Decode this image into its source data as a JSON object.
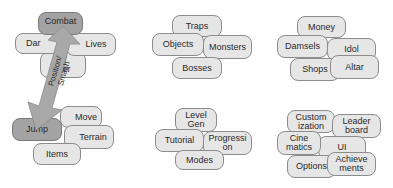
{
  "colors": {
    "pill_fill": "#e6e6e6",
    "pill_fill_primary": "#a3a3a3",
    "pill_border": "#8c8c8c",
    "arrow_fill": "#a8a8a8",
    "text": "#2a2a2a"
  },
  "groups": [
    {
      "id": "combat-movement",
      "pills": [
        {
          "label": "Combat",
          "primary": true
        },
        {
          "label": "Damage",
          "visible_text": "Dar"
        },
        {
          "label": "Lives"
        },
        {
          "label": "e/\ncter",
          "partially_hidden": true
        },
        {
          "label": "Move"
        },
        {
          "label": "Jump",
          "primary": true
        },
        {
          "label": "Terrain"
        },
        {
          "label": "Items"
        }
      ],
      "arrow": {
        "label": "Position/\nSmash",
        "direction": "bidirectional",
        "from": "Combat",
        "to": "Jump"
      }
    },
    {
      "id": "enemies",
      "pills": [
        {
          "label": "Traps"
        },
        {
          "label": "Objects"
        },
        {
          "label": "Monsters"
        },
        {
          "label": "Bosses"
        }
      ]
    },
    {
      "id": "economy",
      "pills": [
        {
          "label": "Money"
        },
        {
          "label": "Damsels"
        },
        {
          "label": "Idol"
        },
        {
          "label": "Shops"
        },
        {
          "label": "Altar"
        }
      ]
    },
    {
      "id": "structure",
      "pills": [
        {
          "label": "Level\nGen"
        },
        {
          "label": "Tutorial"
        },
        {
          "label": "Progressi\non"
        },
        {
          "label": "Modes"
        }
      ]
    },
    {
      "id": "meta",
      "pills": [
        {
          "label": "Custom\nization"
        },
        {
          "label": "Leader\nboard"
        },
        {
          "label": "Cine\nmatics"
        },
        {
          "label": "UI"
        },
        {
          "label": "Options"
        },
        {
          "label": "Achieve\nments"
        }
      ]
    }
  ]
}
